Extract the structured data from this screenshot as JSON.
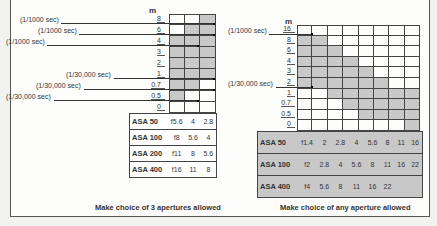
{
  "left_chart": {
    "axis_label": "m",
    "ticks": [
      "8",
      "6",
      "4",
      "3",
      "2",
      "1",
      "0.7",
      "0.5",
      "0"
    ],
    "columns": 3,
    "callouts": [
      {
        "text": "(1/1000 sec)",
        "tick": "8",
        "column": 3
      },
      {
        "text": "(1/1000 sec)",
        "tick": "6",
        "column": 3
      },
      {
        "text": "(1/1000 sec)",
        "tick": "4",
        "column": 2
      },
      {
        "text": "(1/30,000 sec)",
        "tick": "1",
        "column": 3
      },
      {
        "text": "(1/30,000 sec)",
        "tick": "0.7",
        "column": 3
      },
      {
        "text": "(1/30,000 sec)",
        "tick": "0.5",
        "column": 2
      }
    ],
    "table": [
      {
        "name": "ASA 50",
        "values": [
          "f5.6",
          "4",
          "2.8"
        ]
      },
      {
        "name": "ASA 100",
        "values": [
          "f8",
          "5.6",
          "4"
        ]
      },
      {
        "name": "ASA 200",
        "values": [
          "f11",
          "8",
          "5.6"
        ]
      },
      {
        "name": "ASA 400",
        "values": [
          "f16",
          "11",
          "8"
        ]
      }
    ],
    "caption": "Make choice of 3 apertures allowed"
  },
  "right_chart": {
    "axis_label": "m",
    "ticks": [
      "16",
      "8",
      "6",
      "4",
      "3",
      "2",
      "1",
      "0.7",
      "0.5",
      "0"
    ],
    "columns": 8,
    "callouts": [
      {
        "text": "(1/1000 sec)",
        "tick": "16"
      },
      {
        "text": "(1/30,000 sec)",
        "tick": "2"
      }
    ],
    "table": [
      {
        "name": "ASA 50",
        "values": [
          "f1.4",
          "2",
          "2.8",
          "4",
          "5.6",
          "8",
          "11",
          "16"
        ]
      },
      {
        "name": "ASA 100",
        "values": [
          "f2",
          "2.8",
          "4",
          "5.6",
          "8",
          "11",
          "16",
          "22"
        ]
      },
      {
        "name": "ASA 400",
        "values": [
          "f4",
          "5.6",
          "8",
          "11",
          "16",
          "22"
        ]
      }
    ],
    "caption": "Make choice of any aperture allowed"
  },
  "colors": {
    "shade": "#c8c8c8",
    "table_bg_right": "#c8c8c8",
    "line": "#333333"
  }
}
